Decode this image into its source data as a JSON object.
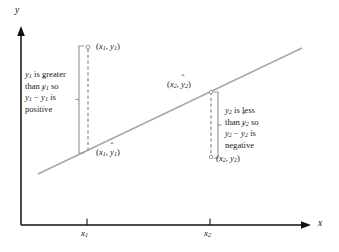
{
  "figure": {
    "type": "residual-regression-diagram",
    "background": "#ffffff",
    "line_color": "#a8a8a8",
    "axis_color": "#111111",
    "bracket_color": "#9a9a9a",
    "dash_color": "#8e8e8e"
  },
  "axes": {
    "x_label": "x",
    "y_label": "y",
    "x_ticks": [
      {
        "label_base": "x",
        "label_sub": "1",
        "px": 87
      },
      {
        "label_base": "x",
        "label_sub": "2",
        "px": 210
      }
    ]
  },
  "regression_line": {
    "x1": 38,
    "y1": 174,
    "x2": 302,
    "y2": 48
  },
  "points": [
    {
      "id": "point-1-observed",
      "label_text": "(x1, y1)",
      "base_a": "x",
      "sub_a": "1",
      "base_b": "y",
      "sub_b": "1",
      "hat_b": false,
      "px": 88,
      "py": 47
    },
    {
      "id": "point-1-predicted",
      "label_text": "(x1, y-hat 1)",
      "base_a": "x",
      "sub_a": "1",
      "base_b": "y",
      "sub_b": "1",
      "hat_b": true,
      "px": 88,
      "py": 152
    },
    {
      "id": "point-2-predicted",
      "label_text": "(x2, y-hat 2)",
      "base_a": "x",
      "sub_a": "2",
      "base_b": "y",
      "sub_b": "2",
      "hat_b": true,
      "px": 211,
      "py": 92
    },
    {
      "id": "point-2-observed",
      "label_text": "(x2, y2)",
      "base_a": "x",
      "sub_a": "2",
      "base_b": "y",
      "sub_b": "2",
      "hat_b": false,
      "px": 211,
      "py": 157
    }
  ],
  "annotations": {
    "left": {
      "name": "positive-residual-note",
      "lines": [
        {
          "l": "y",
          "sub": "1",
          "rest": " is greater",
          "hat": false
        },
        {
          "pre": "than ",
          "l": "y",
          "sub": "1",
          "rest": " so",
          "hat": true
        },
        {
          "l": "y",
          "sub": "1",
          "mid": " − ",
          "l2": "y",
          "sub2": "1",
          "rest": " is",
          "hat2": true
        },
        {
          "plain": "positive"
        }
      ],
      "full_text": "y1 is greater than y-hat 1 so y1 - y-hat 1 is positive"
    },
    "right": {
      "name": "negative-residual-note",
      "lines": [
        {
          "l": "y",
          "sub": "2",
          "rest": " is less",
          "hat": false
        },
        {
          "pre": "than ",
          "l": "y",
          "sub": "2",
          "rest": " so",
          "hat": true
        },
        {
          "l": "y",
          "sub": "2",
          "mid": " − ",
          "l2": "y",
          "sub2": "2",
          "rest": " is",
          "hat2": true
        },
        {
          "plain": "negative"
        }
      ],
      "full_text": "y2 is less than y-hat 2 so y2 - y-hat 2 is negative"
    }
  },
  "brackets": [
    {
      "name": "left-residual-bracket",
      "x": 79,
      "top": 46,
      "bottom": 153
    },
    {
      "name": "right-residual-bracket",
      "x": 218,
      "top": 92,
      "bottom": 158
    }
  ]
}
